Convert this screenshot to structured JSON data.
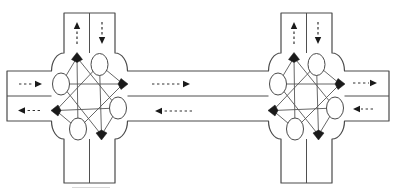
{
  "figure": {
    "canvas": {
      "width": 396,
      "height": 190
    },
    "colors": {
      "background": "#ffffff",
      "road_outline": "#4a4a4a",
      "lane_divider": "#4f4f4f",
      "graph_edge": "#565656",
      "node_outline": "#4a4a4a",
      "node_fill": "#ffffff",
      "marker_fill": "#1a1a1a",
      "arrow_stroke": "#333333",
      "artifact": "#d9d9d9"
    },
    "layout": {
      "v_road": {
        "half_width": 25.5,
        "top_y": 13,
        "bottom_y": 183
      },
      "h_road": {
        "y1": 71,
        "y2": 121,
        "divider_y": 96,
        "left_end_x": 7,
        "right_end_x": 389
      },
      "box": {
        "y1": 53,
        "y2": 139,
        "half_width": 38,
        "corner_rx": 12.5,
        "corner_ry": 18
      },
      "center_y": 96
    },
    "intersections": [
      {
        "name": "left-intersection",
        "cx": 89.5
      },
      {
        "name": "right-intersection",
        "cx": 306.5
      }
    ],
    "graph": {
      "exit_nodes": {
        "north": [
          -12.5,
          -38.5
        ],
        "east": [
          33.5,
          -12
        ],
        "south": [
          12,
          39
        ],
        "west": [
          -33.5,
          14.5
        ]
      },
      "entry_nodes": {
        "northeast": [
          10,
          -31.5
        ],
        "northwest": [
          -28.5,
          -12
        ],
        "southeast": [
          28.5,
          12
        ],
        "southwest": [
          -11.5,
          33
        ]
      },
      "entry_rx": 8.5,
      "entry_ry": 11,
      "exit_size": {
        "length": 5,
        "width": 5.5
      },
      "connections": [
        [
          "northwest",
          "east"
        ],
        [
          "northwest",
          "north"
        ],
        [
          "northwest",
          "south"
        ],
        [
          "northeast",
          "south"
        ],
        [
          "northeast",
          "east"
        ],
        [
          "northeast",
          "west"
        ],
        [
          "southeast",
          "west"
        ],
        [
          "southeast",
          "north"
        ],
        [
          "southeast",
          "south"
        ],
        [
          "southwest",
          "north"
        ],
        [
          "southwest",
          "west"
        ],
        [
          "southwest",
          "east"
        ]
      ]
    },
    "arrows": [
      {
        "name": "left-north-road-outbound-arrow",
        "dir": "up",
        "tail": [
          77,
          44
        ],
        "head": [
          77,
          22
        ]
      },
      {
        "name": "left-north-road-inbound-arrow",
        "dir": "down",
        "tail": [
          102,
          22
        ],
        "head": [
          102,
          44
        ]
      },
      {
        "name": "left-west-road-inbound-arrow",
        "dir": "right",
        "tail": [
          19,
          84
        ],
        "head": [
          42,
          84
        ]
      },
      {
        "name": "left-west-road-outbound-arrow",
        "dir": "left",
        "tail": [
          40,
          110.5
        ],
        "head": [
          18,
          110.5
        ]
      },
      {
        "name": "connecting-road-eastbound-arrow",
        "dir": "right",
        "tail": [
          152,
          84
        ],
        "head": [
          190,
          84
        ]
      },
      {
        "name": "connecting-road-westbound-arrow",
        "dir": "left",
        "tail": [
          192,
          111
        ],
        "head": [
          155,
          111
        ]
      },
      {
        "name": "right-north-road-outbound-arrow",
        "dir": "up",
        "tail": [
          294,
          44
        ],
        "head": [
          294,
          22
        ]
      },
      {
        "name": "right-north-road-inbound-arrow",
        "dir": "down",
        "tail": [
          318,
          22
        ],
        "head": [
          318,
          44
        ]
      },
      {
        "name": "right-east-road-outbound-arrow",
        "dir": "right",
        "tail": [
          353,
          83
        ],
        "head": [
          377,
          83
        ]
      },
      {
        "name": "right-east-road-inbound-arrow",
        "dir": "left",
        "tail": [
          373,
          109
        ],
        "head": [
          353,
          109
        ]
      }
    ],
    "artifacts": [
      {
        "name": "scan-artifact-line",
        "x1": 72,
        "y1": 187.5,
        "x2": 110,
        "y2": 187.5
      }
    ]
  }
}
